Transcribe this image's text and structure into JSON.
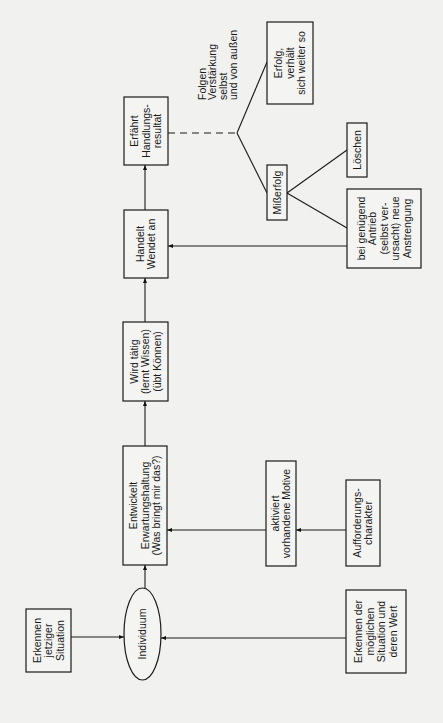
{
  "colors": {
    "background": "#f1f1ef",
    "stroke": "#1a1a1a"
  },
  "nodes": {
    "erkennen_jetzig": {
      "lines": [
        "Erkennen",
        "jetziger",
        "Situation"
      ]
    },
    "individuum": {
      "lines": [
        "Individuum"
      ]
    },
    "erkennen_moeglich": {
      "lines": [
        "Erkennen der",
        "möglichen",
        "Situation und",
        "deren Wert"
      ]
    },
    "entwickelt": {
      "lines": [
        "Entwickelt",
        "Erwartungshaltung",
        "(Was bringt mir das?)"
      ]
    },
    "aktiviert": {
      "lines": [
        "aktiviert",
        "vorhandene Motive"
      ]
    },
    "aufforderung": {
      "lines": [
        "Aufforderungs-",
        "charakter"
      ]
    },
    "wird_taetig": {
      "lines": [
        "Wird tätig",
        "(lernt Wissen)",
        "(übt Können)"
      ]
    },
    "handelt": {
      "lines": [
        "Handelt",
        "Wendet an"
      ]
    },
    "erfaehrt": {
      "lines": [
        "Erfährt",
        "Handlungs-",
        "resultat"
      ]
    },
    "folgen_label": {
      "lines": [
        "Folgen",
        "Verstärkung",
        "selbst",
        "und von außen"
      ]
    },
    "erfolg": {
      "lines": [
        "Erfolg,",
        "verhält",
        "sich weiter so"
      ]
    },
    "misserfolg": {
      "lines": [
        "Mißerfolg"
      ]
    },
    "loeschen": {
      "lines": [
        "Löschen"
      ]
    },
    "neue_anstrengung": {
      "lines": [
        "bei genügend",
        "Antrieb",
        "(selbst ver-",
        "ursacht) neue",
        "Anstrengung"
      ]
    }
  }
}
